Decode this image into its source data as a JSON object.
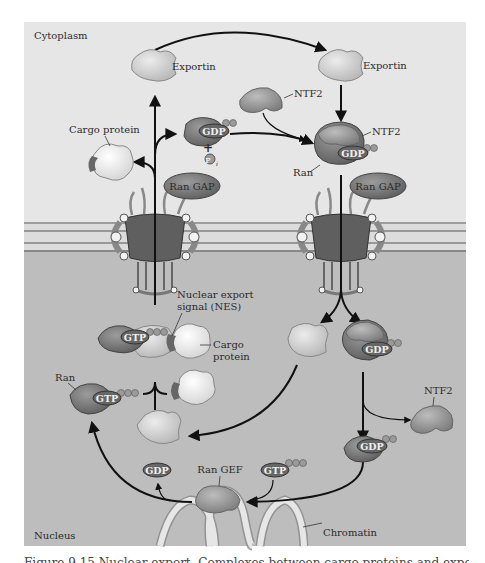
{
  "figure": {
    "regions": {
      "top": "Cytoplasm",
      "bottom": "Nucleus"
    },
    "labels": {
      "exportin_left": "Exportin",
      "exportin_right": "Exportin",
      "ntf2_top": "NTF2",
      "ntf2_complex": "NTF2",
      "ntf2_nucleus": "NTF2",
      "cargo_cytoplasm": "Cargo protein",
      "cargo_nucleus_line1": "Cargo",
      "cargo_nucleus_line2": "protein",
      "ran_complex": "Ran",
      "ran_nucleus": "Ran",
      "ran_gap_left": "Ran GAP",
      "ran_gap_right": "Ran GAP",
      "nes_line1": "Nuclear export",
      "nes_line2": "signal (NES)",
      "ran_gef": "Ran GEF",
      "chromatin": "Chromatin",
      "plus": "+",
      "pi": "P",
      "pi_sub": "i"
    },
    "nucleotides": {
      "gdp_cyto": "GDP",
      "gdp_complex": "GDP",
      "gtp_nes": "GTP",
      "gdp_nuc_complex": "GDP",
      "gtp_ran": "GTP",
      "gdp_nuc_ran": "GDP",
      "gdp_free": "GDP",
      "gtp_free": "GTP"
    },
    "colors": {
      "cytoplasm_bg": "#e6e6e6",
      "nucleus_bg": "#bdbdbd",
      "ran": "#7a7a7a",
      "exportin": "#d2d2d2",
      "ntf2": "#9a9a9a",
      "pill": "#6a6a6a",
      "arrow": "#111111"
    },
    "caption": "Figure 9.15  Nuclear export.  Complexes between cargo proteins and exportin"
  }
}
